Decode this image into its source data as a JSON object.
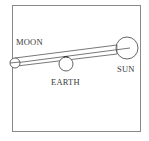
{
  "diagram": {
    "labels": {
      "moon": "MOON",
      "earth": "EARTH",
      "sun": "SUN"
    },
    "bodies": [
      {
        "name": "moon",
        "cx": 15,
        "cy": 63,
        "r": 5
      },
      {
        "name": "earth",
        "cx": 66,
        "cy": 64,
        "r": 7
      },
      {
        "name": "sun",
        "cx": 127,
        "cy": 48,
        "r": 11
      }
    ],
    "colors": {
      "stroke": "#555555",
      "frame": "#777777",
      "text": "#3a3a3a",
      "background": "#ffffff"
    }
  }
}
